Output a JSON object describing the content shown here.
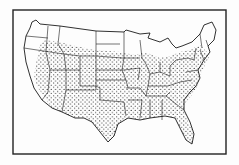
{
  "figure": {
    "style": "black-and-white line drawing with dot stippling",
    "colors": {
      "ink": "#1a1a1a",
      "paper": "#fdfdfd"
    },
    "legend": null,
    "title": null
  },
  "map": {
    "regions_stippled": "Most interior, southern, and eastern states",
    "regions_unstippled": [
      "Washington (west)",
      "Oregon (west)",
      "California (north/coast)",
      "Montana (north)",
      "North Dakota (north)",
      "Minnesota (north)",
      "Wisconsin (north)",
      "Michigan",
      "Maine",
      "Northern New England"
    ]
  }
}
